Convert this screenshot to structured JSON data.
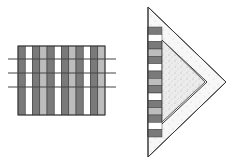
{
  "figure": {
    "left": {
      "description": "rectangle of vertical stripes crossed by three horizontal lines",
      "rect": {
        "x": 18,
        "y": 46,
        "w": 87,
        "h": 69
      },
      "stripes": [
        "dark",
        "white",
        "dark",
        "light",
        "dark",
        "white",
        "dark",
        "light",
        "dark",
        "white",
        "dark",
        "light"
      ],
      "lines_y": [
        59,
        73,
        87
      ],
      "line_x_start": 8,
      "line_x_end": 116
    },
    "right": {
      "description": "triangle pointing right with striped column and speckled inner triangle",
      "outer": {
        "points": "148,7 226,82 148,157"
      },
      "inner": {
        "points": "162,40 205,82 162,122"
      },
      "column_stripes": [
        "dark",
        "white",
        "dark",
        "light",
        "dark",
        "white",
        "dark",
        "light",
        "dark",
        "white",
        "dark",
        "light",
        "dark",
        "white",
        "dark"
      ]
    },
    "colors": {
      "dark": "#7a7a7a",
      "light": "#bdbdbd",
      "white": "#ffffff",
      "stroke": "#3a3a3a",
      "speckle": "#e2e2e2"
    }
  }
}
